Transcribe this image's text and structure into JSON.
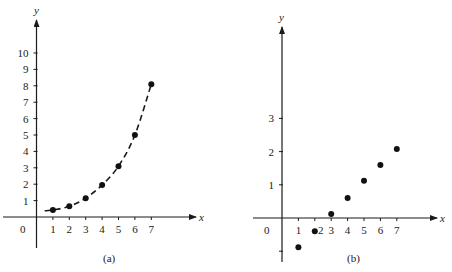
{
  "chart_data": [
    {
      "id": "a",
      "type": "line",
      "caption": "(a)",
      "xlabel": "x",
      "ylabel": "y",
      "x_ticks": [
        1,
        2,
        3,
        4,
        5,
        6,
        7
      ],
      "y_ticks": [
        1,
        2,
        3,
        4,
        5,
        6,
        7,
        8,
        9,
        10
      ],
      "origin_label": "0",
      "xlim": [
        0,
        9.5
      ],
      "ylim": [
        -1.9,
        12
      ],
      "grid": false,
      "line_style": "dashed",
      "series": [
        {
          "name": "exponential data",
          "x": [
            1,
            2,
            3,
            4,
            5,
            6,
            7
          ],
          "values": [
            0.43,
            0.65,
            1.15,
            1.95,
            3.1,
            5.0,
            8.1
          ],
          "markers": true
        }
      ]
    },
    {
      "id": "b",
      "type": "scatter",
      "caption": "(b)",
      "xlabel": "x",
      "ylabel": "y",
      "x_ticks": [
        1,
        2,
        3,
        4,
        5,
        6,
        7
      ],
      "y_ticks": [
        -1,
        1,
        2,
        3
      ],
      "y_tick_labels": [
        "",
        "1",
        "2",
        "3"
      ],
      "origin_label": "0",
      "xlim": [
        -1.8,
        9.5
      ],
      "ylim": [
        -1.3,
        5.8
      ],
      "grid": false,
      "series": [
        {
          "name": "log-transformed data",
          "x": [
            1,
            2,
            3,
            4,
            5,
            6,
            7
          ],
          "values": [
            -0.88,
            -0.4,
            0.12,
            0.6,
            1.12,
            1.6,
            2.08
          ],
          "markers": true
        }
      ]
    }
  ]
}
